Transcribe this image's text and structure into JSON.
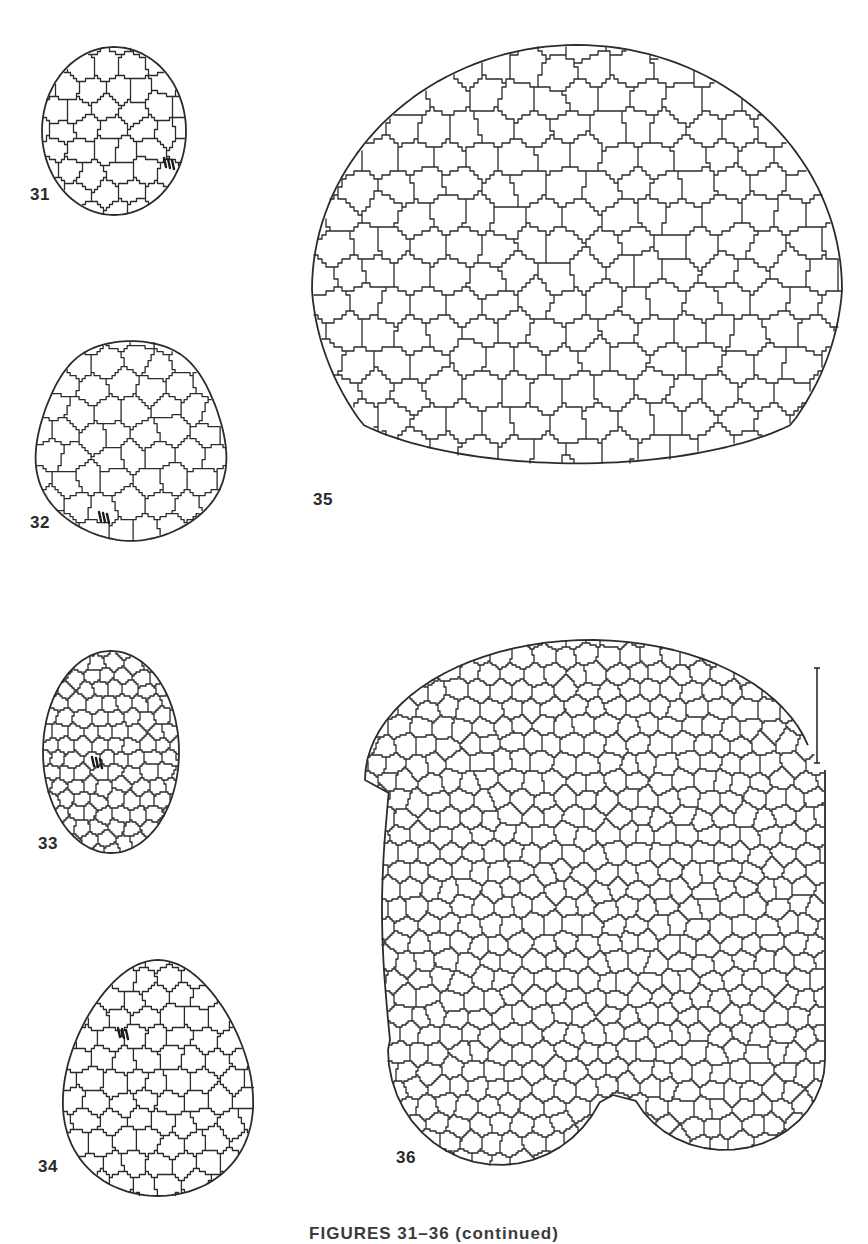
{
  "plate": {
    "caption": "FIGURES 31–36 (continued)",
    "line_color": "#2b2b2b",
    "background": "#ffffff"
  },
  "figures": [
    {
      "id": "fig31",
      "label": "31",
      "label_pos": [
        30,
        200
      ],
      "shape": "ellipse",
      "cx": 114,
      "cy": 131,
      "rx": 72,
      "ry": 84,
      "cell": 25,
      "mitosis": [
        {
          "x": 168,
          "y": 163
        }
      ]
    },
    {
      "id": "fig32",
      "label": "32",
      "label_pos": [
        30,
        528
      ],
      "shape": "blob",
      "cx": 131,
      "cy": 441,
      "rx": 94,
      "ry": 104,
      "cell": 28,
      "mitosis": [
        {
          "x": 103,
          "y": 517
        }
      ]
    },
    {
      "id": "fig33",
      "label": "33",
      "label_pos": [
        38,
        849
      ],
      "shape": "ellipse",
      "cx": 111,
      "cy": 752,
      "rx": 68,
      "ry": 101,
      "cell": 16,
      "mitosis": [
        {
          "x": 96,
          "y": 762
        }
      ]
    },
    {
      "id": "fig34",
      "label": "34",
      "label_pos": [
        38,
        1172
      ],
      "shape": "egg",
      "cx": 158,
      "cy": 1078,
      "rx": 93,
      "ry": 118,
      "cell": 24,
      "mitosis": [
        {
          "x": 122,
          "y": 1033
        }
      ]
    },
    {
      "id": "fig35",
      "label": "35",
      "label_pos": [
        313,
        505
      ],
      "shape": "dome",
      "cx": 577,
      "cy": 290,
      "rx": 265,
      "ry": 245,
      "cell": 34,
      "mitosis": []
    },
    {
      "id": "fig36",
      "label": "36",
      "label_pos": [
        396,
        1163
      ],
      "shape": "notched",
      "cx": 605,
      "cy": 905,
      "rx": 220,
      "ry": 265,
      "cell": 21,
      "mitosis": []
    }
  ],
  "scale_bar": {
    "x": 817,
    "y1": 668,
    "y2": 763
  }
}
